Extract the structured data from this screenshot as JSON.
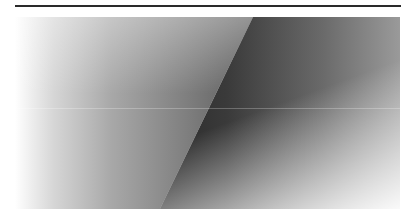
{
  "image": {
    "description": "Grayscale gradient panel split by a diagonal edge",
    "colors": {
      "rule": "#2a2a2a",
      "light": "#ffffff",
      "mid": "#7e7e7e",
      "dark": "#2c2c2c"
    }
  }
}
